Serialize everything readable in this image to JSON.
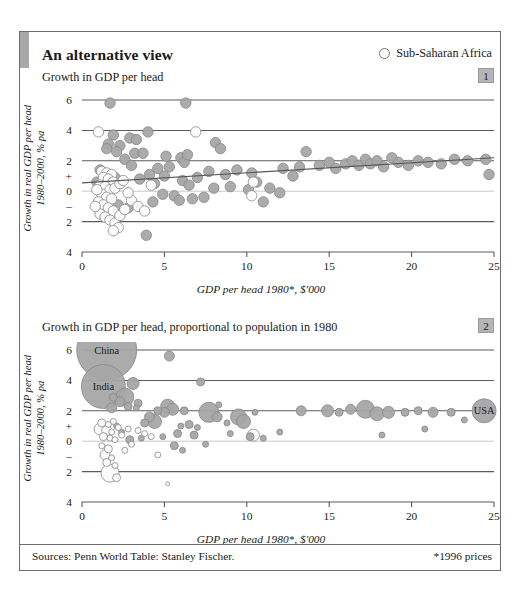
{
  "headline": "An alternative view",
  "legend": {
    "marker": "open-circle",
    "label": "Sub-Saharan Africa"
  },
  "footer": {
    "sources": "Sources: Penn World Table: Stanley Fischer.",
    "note": "*1996 prices"
  },
  "panels": [
    {
      "number": "1",
      "subtitle": "Growth in GDP per head"
    },
    {
      "number": "2",
      "subtitle": "Growth in GDP per head, proportional to population in 1980"
    }
  ],
  "colors": {
    "filled_marker": "#a6a6a6",
    "filled_marker_edge": "#8a8a8a",
    "open_marker": "#fbfbfb",
    "open_marker_edge": "#8f8f8f",
    "gridline": "#5b5b5b",
    "zero_line": "#c9c9c9",
    "trend_line": "#555555",
    "badge": "#b5b5b5",
    "frame": "#6d6d6d"
  },
  "chart_data": [
    {
      "type": "scatter",
      "title": "Growth in GDP per head",
      "panel": "1",
      "xlabel": "GDP per head 1980*, $'000",
      "ylabel": "Growth in real GDP per head 1980–2000, % pa",
      "xlim": [
        0,
        25
      ],
      "ylim": [
        -4,
        6
      ],
      "xticks": [
        0,
        5,
        10,
        15,
        20,
        25
      ],
      "yticks": [
        6,
        4,
        2,
        0,
        -2,
        -4
      ],
      "ytick_labels": [
        "6",
        "4",
        "2",
        "0",
        "2",
        "4"
      ],
      "y_sign_markers": {
        "plus": 1,
        "minus": -1
      },
      "grid": "horizontal",
      "legend_position": "top-right",
      "trend_line": {
        "x0": 0,
        "y0": 0.55,
        "x1": 25,
        "y1": 2.2
      },
      "series": [
        {
          "name": "Rest of world",
          "marker": "filled",
          "points": [
            [
              1.7,
              5.8
            ],
            [
              6.3,
              5.8
            ],
            [
              4.0,
              3.9
            ],
            [
              1.9,
              3.7
            ],
            [
              2.9,
              3.5
            ],
            [
              3.3,
              3.4
            ],
            [
              1.6,
              3.1
            ],
            [
              2.3,
              3.0
            ],
            [
              8.1,
              3.2
            ],
            [
              8.4,
              2.8
            ],
            [
              1.5,
              2.8
            ],
            [
              2.1,
              2.6
            ],
            [
              3.2,
              2.5
            ],
            [
              3.7,
              2.5
            ],
            [
              13.6,
              2.6
            ],
            [
              5.1,
              2.3
            ],
            [
              6.0,
              2.2
            ],
            [
              6.2,
              1.9
            ],
            [
              6.4,
              2.4
            ],
            [
              5.3,
              1.6
            ],
            [
              4.6,
              1.5
            ],
            [
              4.1,
              1.1
            ],
            [
              5.0,
              1.0
            ],
            [
              6.1,
              0.7
            ],
            [
              6.5,
              0.4
            ],
            [
              7.0,
              0.9
            ],
            [
              7.7,
              1.3
            ],
            [
              8.7,
              1.1
            ],
            [
              9.4,
              1.4
            ],
            [
              10.3,
              1.2
            ],
            [
              10.6,
              0.6
            ],
            [
              10.1,
              0.1
            ],
            [
              12.2,
              1.5
            ],
            [
              12.8,
              1.0
            ],
            [
              13.2,
              1.6
            ],
            [
              14.4,
              1.7
            ],
            [
              15.0,
              1.9
            ],
            [
              15.4,
              1.5
            ],
            [
              16.0,
              1.8
            ],
            [
              16.4,
              2.0
            ],
            [
              16.8,
              1.7
            ],
            [
              17.2,
              2.1
            ],
            [
              17.5,
              1.8
            ],
            [
              17.9,
              2.0
            ],
            [
              18.3,
              1.6
            ],
            [
              18.8,
              2.2
            ],
            [
              19.2,
              1.9
            ],
            [
              19.8,
              1.7
            ],
            [
              20.4,
              2.0
            ],
            [
              21.0,
              1.9
            ],
            [
              21.8,
              1.8
            ],
            [
              22.6,
              2.1
            ],
            [
              23.4,
              2.0
            ],
            [
              24.5,
              2.1
            ],
            [
              24.7,
              1.1
            ],
            [
              2.6,
              2.1
            ],
            [
              3.0,
              1.7
            ],
            [
              3.5,
              0.8
            ],
            [
              4.4,
              0.5
            ],
            [
              4.9,
              -0.2
            ],
            [
              5.6,
              -0.3
            ],
            [
              6.7,
              -0.5
            ],
            [
              7.4,
              -0.4
            ],
            [
              5.9,
              -0.6
            ],
            [
              4.3,
              -0.7
            ],
            [
              2.2,
              -0.9
            ],
            [
              1.3,
              -1.4
            ],
            [
              2.8,
              -1.1
            ],
            [
              3.9,
              -2.9
            ],
            [
              11.0,
              -0.7
            ],
            [
              11.4,
              0.2
            ],
            [
              9.0,
              0.3
            ],
            [
              8.0,
              0.2
            ],
            [
              12.0,
              -0.1
            ],
            [
              1.1,
              1.4
            ],
            [
              1.4,
              1.1
            ],
            [
              2.0,
              0.9
            ],
            [
              0.9,
              0.6
            ]
          ]
        },
        {
          "name": "Sub-Saharan Africa",
          "marker": "open",
          "points": [
            [
              1.0,
              3.9
            ],
            [
              6.9,
              3.9
            ],
            [
              1.2,
              1.3
            ],
            [
              1.5,
              1.2
            ],
            [
              1.8,
              1.1
            ],
            [
              1.3,
              0.9
            ],
            [
              1.6,
              0.8
            ],
            [
              1.9,
              0.6
            ],
            [
              1.1,
              0.4
            ],
            [
              1.4,
              0.3
            ],
            [
              1.7,
              0.1
            ],
            [
              2.0,
              0.2
            ],
            [
              2.3,
              0.5
            ],
            [
              1.2,
              -0.2
            ],
            [
              1.5,
              -0.4
            ],
            [
              1.8,
              -0.5
            ],
            [
              1.0,
              -0.7
            ],
            [
              1.3,
              -0.9
            ],
            [
              1.6,
              -1.1
            ],
            [
              1.9,
              -1.3
            ],
            [
              1.1,
              -1.5
            ],
            [
              1.4,
              -1.7
            ],
            [
              1.7,
              -1.9
            ],
            [
              2.0,
              -2.1
            ],
            [
              2.2,
              -2.4
            ],
            [
              1.9,
              -2.6
            ],
            [
              2.3,
              -1.6
            ],
            [
              2.6,
              -1.2
            ],
            [
              3.0,
              -0.6
            ],
            [
              3.4,
              -1.0
            ],
            [
              3.8,
              -1.3
            ],
            [
              4.2,
              0.4
            ],
            [
              10.3,
              -0.3
            ],
            [
              10.4,
              0.6
            ],
            [
              2.5,
              0.7
            ],
            [
              2.8,
              -0.1
            ],
            [
              0.8,
              -1.0
            ],
            [
              0.9,
              0.1
            ]
          ]
        }
      ]
    },
    {
      "type": "bubble",
      "title": "Growth in GDP per head, proportional to population in 1980",
      "panel": "2",
      "xlabel": "GDP per head 1980*, $'000",
      "ylabel": "Growth in real GDP per head 1980–2000, % pa",
      "xlim": [
        0,
        25
      ],
      "ylim": [
        -4,
        6
      ],
      "xticks": [
        0,
        5,
        10,
        15,
        20,
        25
      ],
      "yticks": [
        6,
        4,
        2,
        0,
        -2,
        -4
      ],
      "ytick_labels": [
        "6",
        "4",
        "2",
        "0",
        "2",
        "4"
      ],
      "y_sign_markers": {
        "plus": 1,
        "minus": -1
      },
      "grid": "horizontal",
      "size_meaning": "population in 1980",
      "labelled_bubbles": [
        {
          "label": "China",
          "x": 1.5,
          "y": 6.0,
          "r": 30
        },
        {
          "label": "India",
          "x": 1.3,
          "y": 3.6,
          "r": 22
        },
        {
          "label": "USA",
          "x": 24.4,
          "y": 2.0,
          "r": 12
        }
      ],
      "series": [
        {
          "name": "Rest of world",
          "marker": "filled",
          "points": [
            [
              1.5,
              6.0,
              30
            ],
            [
              1.3,
              3.6,
              22
            ],
            [
              24.4,
              2.0,
              12
            ],
            [
              5.3,
              5.6,
              5
            ],
            [
              7.2,
              3.9,
              4
            ],
            [
              3.1,
              3.8,
              6
            ],
            [
              2.6,
              2.9,
              9
            ],
            [
              2.3,
              2.6,
              5
            ],
            [
              3.4,
              2.5,
              4
            ],
            [
              8.3,
              2.4,
              3
            ],
            [
              1.9,
              2.9,
              4
            ],
            [
              5.2,
              2.3,
              7
            ],
            [
              5.5,
              2.1,
              6
            ],
            [
              6.2,
              2.0,
              4
            ],
            [
              5.0,
              1.9,
              5
            ],
            [
              7.7,
              1.9,
              10
            ],
            [
              8.2,
              1.6,
              5
            ],
            [
              9.5,
              1.6,
              8
            ],
            [
              9.8,
              1.3,
              7
            ],
            [
              10.5,
              1.9,
              3
            ],
            [
              13.3,
              2.0,
              5
            ],
            [
              14.9,
              2.0,
              6
            ],
            [
              15.6,
              1.9,
              4
            ],
            [
              16.3,
              2.1,
              5
            ],
            [
              17.2,
              2.1,
              9
            ],
            [
              17.9,
              1.8,
              7
            ],
            [
              18.6,
              1.9,
              6
            ],
            [
              19.6,
              1.9,
              4
            ],
            [
              20.4,
              2.0,
              4
            ],
            [
              21.3,
              1.9,
              5
            ],
            [
              22.4,
              1.9,
              4
            ],
            [
              23.2,
              1.4,
              3
            ],
            [
              4.1,
              1.6,
              5
            ],
            [
              4.4,
              1.3,
              7
            ],
            [
              3.8,
              1.2,
              4
            ],
            [
              6.0,
              1.0,
              3
            ],
            [
              6.5,
              1.1,
              4
            ],
            [
              7.0,
              0.9,
              3
            ],
            [
              5.8,
              0.5,
              4
            ],
            [
              6.8,
              0.4,
              4
            ],
            [
              4.9,
              0.3,
              3
            ],
            [
              3.6,
              0.2,
              3
            ],
            [
              2.9,
              0.1,
              4
            ],
            [
              5.6,
              -0.3,
              4
            ],
            [
              6.1,
              -0.6,
              3
            ],
            [
              9.0,
              0.5,
              3
            ],
            [
              10.2,
              0.3,
              4
            ],
            [
              11.0,
              0.2,
              3
            ],
            [
              12.0,
              0.6,
              3
            ],
            [
              2.1,
              1.0,
              3
            ],
            [
              2.4,
              0.6,
              3
            ],
            [
              3.3,
              2.2,
              3
            ],
            [
              4.6,
              2.0,
              4
            ],
            [
              1.8,
              2.2,
              5
            ],
            [
              2.8,
              2.3,
              4
            ],
            [
              20.8,
              0.8,
              3
            ],
            [
              18.2,
              0.4,
              3
            ],
            [
              8.8,
              1.2,
              3
            ],
            [
              7.5,
              -0.2,
              3
            ]
          ]
        },
        {
          "name": "Sub-Saharan Africa",
          "marker": "open",
          "points": [
            [
              1.2,
              1.2,
              4
            ],
            [
              1.6,
              1.1,
              3
            ],
            [
              1.9,
              1.3,
              3
            ],
            [
              1.1,
              0.8,
              6
            ],
            [
              1.5,
              0.7,
              5
            ],
            [
              1.8,
              0.6,
              3
            ],
            [
              2.2,
              0.9,
              3
            ],
            [
              1.3,
              0.3,
              4
            ],
            [
              1.7,
              0.2,
              3
            ],
            [
              2.0,
              0.1,
              3
            ],
            [
              1.2,
              -0.3,
              3
            ],
            [
              1.6,
              -0.5,
              4
            ],
            [
              1.4,
              -0.9,
              5
            ],
            [
              1.8,
              -1.1,
              3
            ],
            [
              1.5,
              -1.4,
              4
            ],
            [
              2.0,
              -1.6,
              3
            ],
            [
              1.7,
              -2.1,
              9
            ],
            [
              2.1,
              -2.4,
              4
            ],
            [
              3.4,
              0.7,
              3
            ],
            [
              3.8,
              0.5,
              3
            ],
            [
              4.2,
              0.3,
              3
            ],
            [
              3.0,
              -0.2,
              3
            ],
            [
              2.6,
              -0.6,
              3
            ],
            [
              4.6,
              -0.9,
              3
            ],
            [
              5.2,
              -2.8,
              2
            ],
            [
              10.4,
              0.4,
              6
            ],
            [
              2.4,
              0.4,
              3
            ],
            [
              2.8,
              0.8,
              3
            ]
          ]
        }
      ]
    }
  ]
}
